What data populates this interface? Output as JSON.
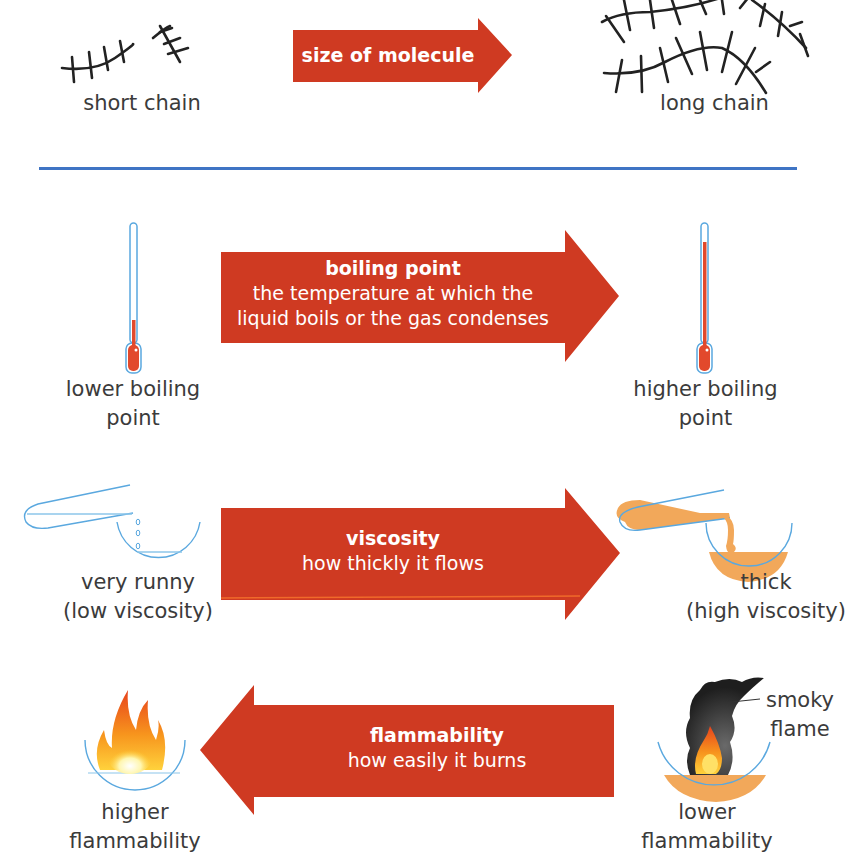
{
  "colors": {
    "arrow": "#cf3a22",
    "divider": "#3f74c4",
    "glass": "#5aa8df",
    "mercury": "#e2492c",
    "oil": "#f2a85a",
    "smoke": "#2b2b2b",
    "text": "#3b3b3b"
  },
  "size": {
    "left_label": "short chain",
    "right_label": "long chain",
    "arrow_label": "size of molecule",
    "arrow_direction": "right"
  },
  "properties": [
    {
      "id": "boiling-point",
      "title": "boiling point",
      "description_lines": [
        "the temperature at which the",
        "liquid boils or the gas condenses"
      ],
      "direction": "right",
      "left_label_lines": [
        "lower boiling",
        "point"
      ],
      "right_label_lines": [
        "higher boiling",
        "point"
      ]
    },
    {
      "id": "viscosity",
      "title": "viscosity",
      "description_lines": [
        "how thickly it flows"
      ],
      "direction": "right",
      "left_label_lines": [
        "very runny",
        "(low viscosity)"
      ],
      "right_label_lines": [
        "thick",
        "(high viscosity)"
      ]
    },
    {
      "id": "flammability",
      "title": "flammability",
      "description_lines": [
        "how easily it burns"
      ],
      "direction": "left",
      "left_label_lines": [
        "higher",
        "flammability"
      ],
      "right_label_lines": [
        "lower",
        "flammability"
      ],
      "right_annotation_lines": [
        "smoky",
        "flame"
      ]
    }
  ]
}
